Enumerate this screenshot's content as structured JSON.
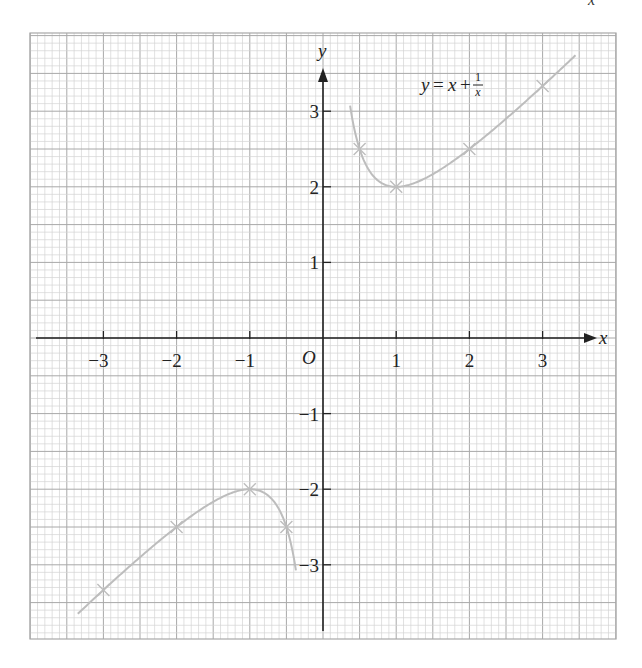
{
  "corner_fragment": "x",
  "chart_data": {
    "type": "line",
    "title": "",
    "equation_label": {
      "lhs": "y",
      "eq": "=",
      "x": "x",
      "plus": "+",
      "num": "1",
      "den": "x",
      "at": [
        1.45,
        3.35
      ]
    },
    "xlabel": "x",
    "ylabel": "y",
    "origin_label": "O",
    "xlim": [
      -3.9,
      4.1
    ],
    "ylim": [
      -4.0,
      4.0
    ],
    "grid": true,
    "x_ticks": [
      -3,
      -2,
      -1,
      1,
      2,
      3
    ],
    "x_tick_labels": [
      "−3",
      "−2",
      "−1",
      "1",
      "2",
      "3"
    ],
    "y_ticks": [
      -3,
      -2,
      -1,
      1,
      2,
      3
    ],
    "y_tick_labels": [
      "−3",
      "−2",
      "−1",
      "1",
      "2",
      "3"
    ],
    "series": [
      {
        "name": "y = x + 1/x (x > 0)",
        "function": "x + 1/x",
        "domain": [
          0.37,
          3.45
        ],
        "marked_points": [
          [
            0.5,
            2.5
          ],
          [
            1,
            2
          ],
          [
            2,
            2.5
          ],
          [
            3,
            3.333
          ]
        ]
      },
      {
        "name": "y = x + 1/x (x < 0)",
        "function": "x + 1/x",
        "domain": [
          -3.35,
          -0.37
        ],
        "marked_points": [
          [
            -3,
            -3.333
          ],
          [
            -2,
            -2.5
          ],
          [
            -1,
            -2
          ],
          [
            -0.5,
            -2.5
          ]
        ]
      }
    ],
    "colors": {
      "grid_minor": "#d4d4d4",
      "grid_major": "#a8a8a8",
      "axis": "#222222",
      "curve": "#bdbdbd",
      "text": "#222222"
    }
  }
}
